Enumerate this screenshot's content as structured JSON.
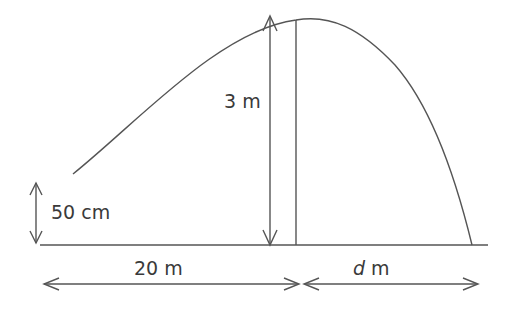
{
  "diagram": {
    "labels": {
      "launch_height": "50 cm",
      "max_height": "3 m",
      "horizontal_to_peak": "20 m",
      "horizontal_after_peak_var": "d",
      "horizontal_after_peak_unit": " m"
    },
    "colors": {
      "line": "#555555",
      "text": "#3a3a3a",
      "background": "#ffffff"
    }
  }
}
